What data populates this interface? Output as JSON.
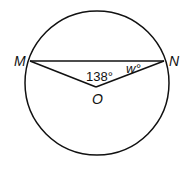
{
  "diagram": {
    "type": "circle-geometry",
    "points": {
      "M": {
        "label": "M"
      },
      "N": {
        "label": "N"
      },
      "O": {
        "label": "O"
      }
    },
    "angles": {
      "central_angle": "138°",
      "w_angle": "w°"
    },
    "stroke_color": "#111111"
  }
}
